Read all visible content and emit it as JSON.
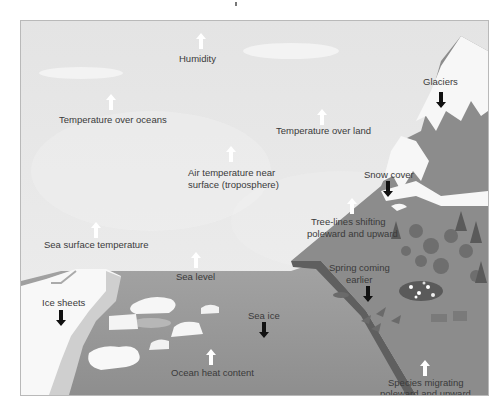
{
  "diagram": {
    "title": "",
    "style": "grayscale illustration",
    "colors": {
      "sky": "#e9e9e9",
      "cloud": "#f4f4f4",
      "ocean": "#9a9a9a",
      "mountain": "#8a8a8a",
      "snow": "#f7f7f7",
      "ice": "#f2f2f2",
      "text": "#3a3a3a",
      "arrow_up": "#ffffff",
      "arrow_down": "#111111"
    },
    "indicators": [
      {
        "label": "Humidity",
        "direction": "up"
      },
      {
        "label": "Temperature over oceans",
        "direction": "up"
      },
      {
        "label": "Temperature over land",
        "direction": "up"
      },
      {
        "label": "Air temperature near",
        "label2": "surface (troposphere)",
        "direction": "up"
      },
      {
        "label": "Glaciers",
        "direction": "down"
      },
      {
        "label": "Snow cover",
        "direction": "down"
      },
      {
        "label": "Tree-lines shifting",
        "label2": "poleward and upward",
        "direction": "up"
      },
      {
        "label": "Sea surface temperature",
        "direction": "up"
      },
      {
        "label": "Sea level",
        "direction": "up"
      },
      {
        "label": "Ice sheets",
        "direction": "down"
      },
      {
        "label": "Spring coming",
        "label2": "earlier",
        "direction": "down"
      },
      {
        "label": "Sea ice",
        "direction": "down"
      },
      {
        "label": "Ocean heat content",
        "direction": "up"
      },
      {
        "label": "Species migrating",
        "label2": "poleward and upward",
        "direction": "up"
      }
    ]
  }
}
